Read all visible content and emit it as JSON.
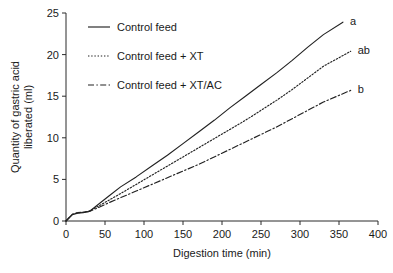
{
  "chart_data": {
    "type": "line",
    "title": "",
    "xlabel": "Digestion time (min)",
    "ylabel": "Quantity of gastric acid liberated (ml)",
    "ylabel_line1": "Quantity of gastric acid",
    "ylabel_line2": "liberated (ml)",
    "xlim": [
      0,
      400
    ],
    "ylim": [
      0,
      25
    ],
    "xticks": [
      0,
      50,
      100,
      150,
      200,
      250,
      300,
      350,
      400
    ],
    "xtick_labels": [
      "0",
      "50",
      "100",
      "150",
      "200",
      "250",
      "300",
      "350",
      "400"
    ],
    "yticks": [
      0,
      5,
      10,
      15,
      20,
      25
    ],
    "ytick_labels": [
      "0",
      "5",
      "10",
      "15",
      "20",
      "25"
    ],
    "grid": false,
    "legend_position": "upper-left-inside",
    "series": [
      {
        "name": "Control feed",
        "style": "solid",
        "color": "#222222",
        "endpoint_annotation": "a",
        "x": [
          0,
          8,
          15,
          22,
          30,
          40,
          55,
          70,
          90,
          110,
          130,
          150,
          170,
          190,
          210,
          230,
          250,
          270,
          290,
          310,
          330,
          355
        ],
        "y": [
          0.0,
          0.75,
          0.95,
          1.0,
          1.15,
          1.9,
          3.0,
          4.1,
          5.3,
          6.6,
          7.9,
          9.3,
          10.7,
          12.1,
          13.6,
          15.0,
          16.4,
          17.8,
          19.3,
          20.9,
          22.4,
          23.9
        ]
      },
      {
        "name": "Control feed + XT",
        "style": "dotted",
        "color": "#222222",
        "endpoint_annotation": "ab",
        "x": [
          0,
          8,
          15,
          22,
          30,
          40,
          55,
          70,
          90,
          110,
          130,
          150,
          170,
          190,
          210,
          230,
          250,
          270,
          290,
          310,
          330,
          365
        ],
        "y": [
          0.0,
          0.8,
          1.0,
          1.05,
          1.2,
          1.7,
          2.5,
          3.3,
          4.4,
          5.5,
          6.6,
          7.7,
          8.8,
          9.9,
          11.0,
          12.1,
          13.3,
          14.5,
          15.8,
          17.2,
          18.6,
          20.4
        ]
      },
      {
        "name": "Control feed + XT/AC",
        "style": "dashdot",
        "color": "#222222",
        "endpoint_annotation": "b",
        "x": [
          0,
          8,
          15,
          22,
          30,
          40,
          55,
          70,
          90,
          110,
          130,
          150,
          170,
          190,
          210,
          230,
          250,
          270,
          290,
          310,
          330,
          365
        ],
        "y": [
          0.0,
          0.8,
          1.0,
          1.05,
          1.15,
          1.55,
          2.2,
          2.8,
          3.6,
          4.4,
          5.2,
          6.0,
          6.8,
          7.7,
          8.6,
          9.5,
          10.4,
          11.3,
          12.3,
          13.3,
          14.3,
          15.7
        ]
      }
    ]
  },
  "legend": {
    "items": [
      {
        "label": "Control feed",
        "style": "solid"
      },
      {
        "label": "Control feed + XT",
        "style": "dotted"
      },
      {
        "label": "Control feed + XT/AC",
        "style": "dashdot"
      }
    ]
  }
}
